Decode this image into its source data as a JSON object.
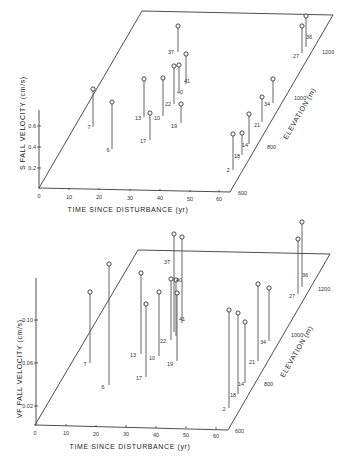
{
  "chart_data": [
    {
      "type": "scatter",
      "subtype": "3d-stem",
      "title": "",
      "xlabel": "TIME SINCE DISTURBANCE (yr)",
      "ylabel": "ELEVATION (m)",
      "zlabel": "S FALL VELOCITY (cm/s)",
      "x_ticks": [
        "0",
        "10",
        "20",
        "30",
        "40",
        "50",
        "60"
      ],
      "y_ticks": [
        "600",
        "800",
        "1000",
        "1200"
      ],
      "z_ticks": [
        "0.2",
        "0.4",
        "0.6"
      ],
      "grid": false,
      "points": [
        {
          "label": "7",
          "z": 0.62
        },
        {
          "label": "6",
          "z": 0.48
        },
        {
          "label": "13",
          "z": 0.4
        },
        {
          "label": "17",
          "z": 0.36
        },
        {
          "label": "10",
          "z": 0.38
        },
        {
          "label": "22",
          "z": 0.42
        },
        {
          "label": "40",
          "z": 0.45
        },
        {
          "label": "19",
          "z": 0.3
        },
        {
          "label": "37",
          "z": 0.3
        },
        {
          "label": "41",
          "z": 0.35
        },
        {
          "label": "2",
          "z": 0.4
        },
        {
          "label": "18",
          "z": 0.29
        },
        {
          "label": "14",
          "z": 0.35
        },
        {
          "label": "21",
          "z": 0.33
        },
        {
          "label": "34",
          "z": 0.28
        },
        {
          "label": "27",
          "z": 0.38
        },
        {
          "label": "36",
          "z": 0.4
        }
      ]
    },
    {
      "type": "scatter",
      "subtype": "3d-stem",
      "title": "",
      "xlabel": "TIME SINCE DISTURBANCE (yr)",
      "ylabel": "ELEVATION (m)",
      "zlabel": "VF FALL VELOCITY (cm/s)",
      "x_ticks": [
        "0",
        "10",
        "20",
        "30",
        "40",
        "50",
        "60"
      ],
      "y_ticks": [
        "600",
        "800",
        "1000",
        "1200"
      ],
      "z_ticks": [
        "0.02",
        "0.06",
        "0.10"
      ],
      "grid": false,
      "points": [
        {
          "label": "7",
          "z": 0.115
        },
        {
          "label": "6",
          "z": 0.12
        },
        {
          "label": "13",
          "z": 0.118
        },
        {
          "label": "17",
          "z": 0.105
        },
        {
          "label": "10",
          "z": 0.098
        },
        {
          "label": "22",
          "z": 0.088
        },
        {
          "label": "40",
          "z": 0.082
        },
        {
          "label": "19",
          "z": 0.08
        },
        {
          "label": "37",
          "z": 0.112
        },
        {
          "label": "41",
          "z": 0.118
        },
        {
          "label": "2",
          "z": 0.13
        },
        {
          "label": "18",
          "z": 0.115
        },
        {
          "label": "14",
          "z": 0.09
        },
        {
          "label": "21",
          "z": 0.11
        },
        {
          "label": "34",
          "z": 0.08
        },
        {
          "label": "27",
          "z": 0.078
        },
        {
          "label": "36",
          "z": 0.09
        }
      ]
    }
  ],
  "top": {
    "zlabel": "S FALL VELOCITY (cm/s)",
    "xlabel": "TIME SINCE DISTURBANCE (yr)",
    "ylabel": "ELEVATION (m)",
    "x_ticks": [
      {
        "t": "0",
        "x": 39,
        "y": 197
      },
      {
        "t": "10",
        "x": 69,
        "y": 198
      },
      {
        "t": "20",
        "x": 99,
        "y": 198
      },
      {
        "t": "30",
        "x": 130,
        "y": 199
      },
      {
        "t": "40",
        "x": 160,
        "y": 199
      },
      {
        "t": "50",
        "x": 190,
        "y": 200
      },
      {
        "t": "60",
        "x": 219,
        "y": 200
      }
    ],
    "z_ticks": [
      {
        "t": "0.2",
        "y": 168
      },
      {
        "t": "0.4",
        "y": 147
      },
      {
        "t": "0.6",
        "y": 126
      }
    ],
    "e_ticks": [
      {
        "t": "600",
        "x": 234,
        "y": 193
      },
      {
        "t": "800",
        "x": 263,
        "y": 147
      },
      {
        "t": "1000",
        "x": 290,
        "y": 98
      },
      {
        "t": "1200",
        "x": 318,
        "y": 52
      }
    ],
    "points": [
      {
        "label": "7",
        "x": 93,
        "top": 89,
        "bot": 127,
        "lx": 89,
        "ly": 129
      },
      {
        "label": "6",
        "x": 112,
        "top": 102,
        "bot": 149,
        "lx": 108,
        "ly": 152
      },
      {
        "label": "13",
        "x": 144,
        "top": 79,
        "bot": 117,
        "lx": 138,
        "ly": 120
      },
      {
        "label": "17",
        "x": 150,
        "top": 113,
        "bot": 140,
        "lx": 143,
        "ly": 143
      },
      {
        "label": "10",
        "x": 163,
        "top": 78,
        "bot": 116,
        "lx": 157,
        "ly": 120
      },
      {
        "label": "22",
        "x": 174,
        "top": 66,
        "bot": 104,
        "lx": 168,
        "ly": 106
      },
      {
        "label": "40",
        "x": 179,
        "top": 65,
        "bot": 90,
        "lx": 180,
        "ly": 94
      },
      {
        "label": "19",
        "x": 181,
        "top": 104,
        "bot": 123,
        "lx": 174,
        "ly": 128
      },
      {
        "label": "37",
        "x": 178,
        "top": 26,
        "bot": 52,
        "lx": 171,
        "ly": 54
      },
      {
        "label": "41",
        "x": 186,
        "top": 54,
        "bot": 84,
        "lx": 187,
        "ly": 83
      },
      {
        "label": "2",
        "x": 233,
        "top": 134,
        "bot": 170,
        "lx": 228,
        "ly": 172
      },
      {
        "label": "18",
        "x": 242,
        "top": 133,
        "bot": 155,
        "lx": 237,
        "ly": 158
      },
      {
        "label": "14",
        "x": 249,
        "top": 114,
        "bot": 144,
        "lx": 245,
        "ly": 147
      },
      {
        "label": "21",
        "x": 262,
        "top": 97,
        "bot": 122,
        "lx": 257,
        "ly": 127
      },
      {
        "label": "34",
        "x": 273,
        "top": 79,
        "bot": 103,
        "lx": 267,
        "ly": 106
      },
      {
        "label": "27",
        "x": 302,
        "top": 26,
        "bot": 53,
        "lx": 296,
        "ly": 58
      },
      {
        "label": "36",
        "x": 306,
        "top": 16,
        "bot": 47,
        "lx": 309,
        "ly": 39
      }
    ]
  },
  "bottom": {
    "zlabel": "VF FALL VELOCITY (cm/s)",
    "xlabel": "TIME SINCE DISTURBANCE (yr)",
    "ylabel": "ELEVATION (m)",
    "x_ticks": [
      {
        "t": "0",
        "x": 35,
        "y": 434
      },
      {
        "t": "10",
        "x": 66,
        "y": 434
      },
      {
        "t": "20",
        "x": 96,
        "y": 435
      },
      {
        "t": "30",
        "x": 126,
        "y": 435
      },
      {
        "t": "40",
        "x": 156,
        "y": 436
      },
      {
        "t": "50",
        "x": 186,
        "y": 436
      },
      {
        "t": "60",
        "x": 216,
        "y": 437
      }
    ],
    "z_ticks": [
      {
        "t": "0.02",
        "y": 406
      },
      {
        "t": "0.06",
        "y": 363
      },
      {
        "t": "0.10",
        "y": 320
      }
    ],
    "e_ticks": [
      {
        "t": "600",
        "x": 231,
        "y": 431
      },
      {
        "t": "800",
        "x": 260,
        "y": 384
      },
      {
        "t": "1000",
        "x": 287,
        "y": 335
      },
      {
        "t": "1200",
        "x": 314,
        "y": 289
      }
    ],
    "points": [
      {
        "label": "7",
        "x": 90,
        "top": 292,
        "bot": 363,
        "lx": 85,
        "ly": 366
      },
      {
        "label": "6",
        "x": 109,
        "top": 264,
        "bot": 385,
        "lx": 103,
        "ly": 389
      },
      {
        "label": "13",
        "x": 141,
        "top": 273,
        "bot": 354,
        "lx": 133,
        "ly": 357
      },
      {
        "label": "17",
        "x": 146,
        "top": 304,
        "bot": 377,
        "lx": 139,
        "ly": 380
      },
      {
        "label": "10",
        "x": 159,
        "top": 292,
        "bot": 356,
        "lx": 152,
        "ly": 360
      },
      {
        "label": "22",
        "x": 171,
        "top": 279,
        "bot": 340,
        "lx": 163,
        "ly": 343
      },
      {
        "label": "40",
        "x": 176,
        "top": 280,
        "bot": 336,
        "lx": 179,
        "ly": 282
      },
      {
        "label": "19",
        "x": 177,
        "top": 293,
        "bot": 361,
        "lx": 170,
        "ly": 366
      },
      {
        "label": "37",
        "x": 174,
        "top": 234,
        "bot": 332,
        "lx": 167,
        "ly": 264
      },
      {
        "label": "41",
        "x": 182,
        "top": 237,
        "bot": 323,
        "lx": 182,
        "ly": 321
      },
      {
        "label": "2",
        "x": 229,
        "top": 310,
        "bot": 408,
        "lx": 224,
        "ly": 411
      },
      {
        "label": "18",
        "x": 238,
        "top": 313,
        "bot": 394,
        "lx": 233,
        "ly": 397
      },
      {
        "label": "14",
        "x": 245,
        "top": 322,
        "bot": 383,
        "lx": 241,
        "ly": 386
      },
      {
        "label": "21",
        "x": 258,
        "top": 284,
        "bot": 361,
        "lx": 252,
        "ly": 364
      },
      {
        "label": "34",
        "x": 269,
        "top": 288,
        "bot": 341,
        "lx": 263,
        "ly": 344
      },
      {
        "label": "27",
        "x": 298,
        "top": 239,
        "bot": 294,
        "lx": 292,
        "ly": 298
      },
      {
        "label": "36",
        "x": 302,
        "top": 222,
        "bot": 287,
        "lx": 305,
        "ly": 277
      }
    ]
  }
}
